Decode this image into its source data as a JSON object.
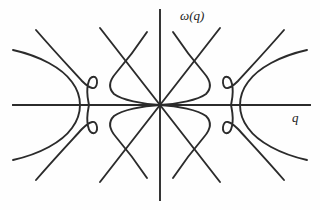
{
  "figure": {
    "title_visible": false,
    "background_color": "#fefefe",
    "line_color": "#2b2b2b"
  },
  "labels": {
    "y_axis": "ω(q)",
    "x_axis": "q"
  },
  "chart_data": {
    "type": "line",
    "title": "",
    "xlabel": "q",
    "ylabel": "ω(q)",
    "grid": false,
    "legend": null,
    "axes": {
      "origin_px": [
        160,
        105
      ],
      "x_axis_span_px": [
        13,
        310
      ],
      "y_axis_span_px": [
        10,
        200
      ],
      "xlim": [
        -1,
        1
      ],
      "ylim": [
        -1,
        1
      ],
      "ticks": [],
      "tick_labels": []
    },
    "series": [
      {
        "name": "acoustic-branch-upper-left",
        "kind": "straight",
        "points_px": [
          [
            160,
            105
          ],
          [
            100,
            28
          ]
        ]
      },
      {
        "name": "acoustic-branch-upper-right",
        "kind": "straight",
        "points_px": [
          [
            160,
            105
          ],
          [
            220,
            28
          ]
        ]
      },
      {
        "name": "acoustic-branch-lower-left",
        "kind": "straight",
        "points_px": [
          [
            160,
            105
          ],
          [
            100,
            182
          ]
        ]
      },
      {
        "name": "acoustic-branch-lower-right",
        "kind": "straight",
        "points_px": [
          [
            160,
            105
          ],
          [
            220,
            182
          ]
        ]
      },
      {
        "name": "central-optical-upper-left",
        "kind": "curve",
        "path": "M 147 32 C 133 53 122 66 116 73 C 109 81 108 88 114 94 C 122 100 142 104 160 105"
      },
      {
        "name": "central-optical-upper-right",
        "kind": "curve",
        "path": "M 173 32 C 187 53 198 66 204 73 C 211 81 212 88 206 94 C 198 100 178 104 160 105"
      },
      {
        "name": "central-optical-lower-left",
        "kind": "curve",
        "path": "M 147 178 C 133 157 122 144 116 137 C 109 129 108 122 114 116 C 122 110 142 106 160 105"
      },
      {
        "name": "central-optical-lower-right",
        "kind": "curve",
        "path": "M 173 178 C 187 157 198 144 204 137 C 211 129 212 122 206 116 C 198 110 178 106 160 105"
      },
      {
        "name": "left-outer-upper",
        "kind": "curve",
        "path": "M 13 50 C 40 56 62 68 72 82 C 78 90 80 98 80 105"
      },
      {
        "name": "left-outer-lower",
        "kind": "curve",
        "path": "M 13 160 C 40 154 62 142 72 128 C 78 120 80 112 80 105"
      },
      {
        "name": "left-inner-s-upper",
        "kind": "curve",
        "path": "M 36 30 C 55 52 72 70 82 81 C 90 89 96 91 97 83 C 98 75 90 74 88 84 C 86 93 88 99 89 105"
      },
      {
        "name": "left-inner-s-lower",
        "kind": "curve",
        "path": "M 36 180 C 55 158 72 140 82 129 C 90 121 96 119 97 127 C 98 135 90 136 88 126 C 86 117 88 111 89 105"
      },
      {
        "name": "right-outer-upper",
        "kind": "curve",
        "path": "M 307 50 C 280 56 258 68 248 82 C 242 90 240 98 240 105"
      },
      {
        "name": "right-outer-lower",
        "kind": "curve",
        "path": "M 307 160 C 280 154 258 142 248 128 C 242 120 240 112 240 105"
      },
      {
        "name": "right-inner-s-upper",
        "kind": "curve",
        "path": "M 284 30 C 265 52 248 70 238 81 C 230 89 224 91 223 83 C 222 75 230 74 232 84 C 234 93 232 99 231 105"
      },
      {
        "name": "right-inner-s-lower",
        "kind": "curve",
        "path": "M 284 180 C 265 158 248 140 238 129 C 230 121 224 119 223 127 C 222 135 230 136 232 126 C 234 117 232 111 231 105"
      }
    ],
    "annotations": [
      {
        "text": "ω(q)",
        "x_px": 180,
        "y_px": 20,
        "style": "italic"
      },
      {
        "text": "q",
        "x_px": 292,
        "y_px": 122,
        "style": "italic"
      }
    ]
  }
}
